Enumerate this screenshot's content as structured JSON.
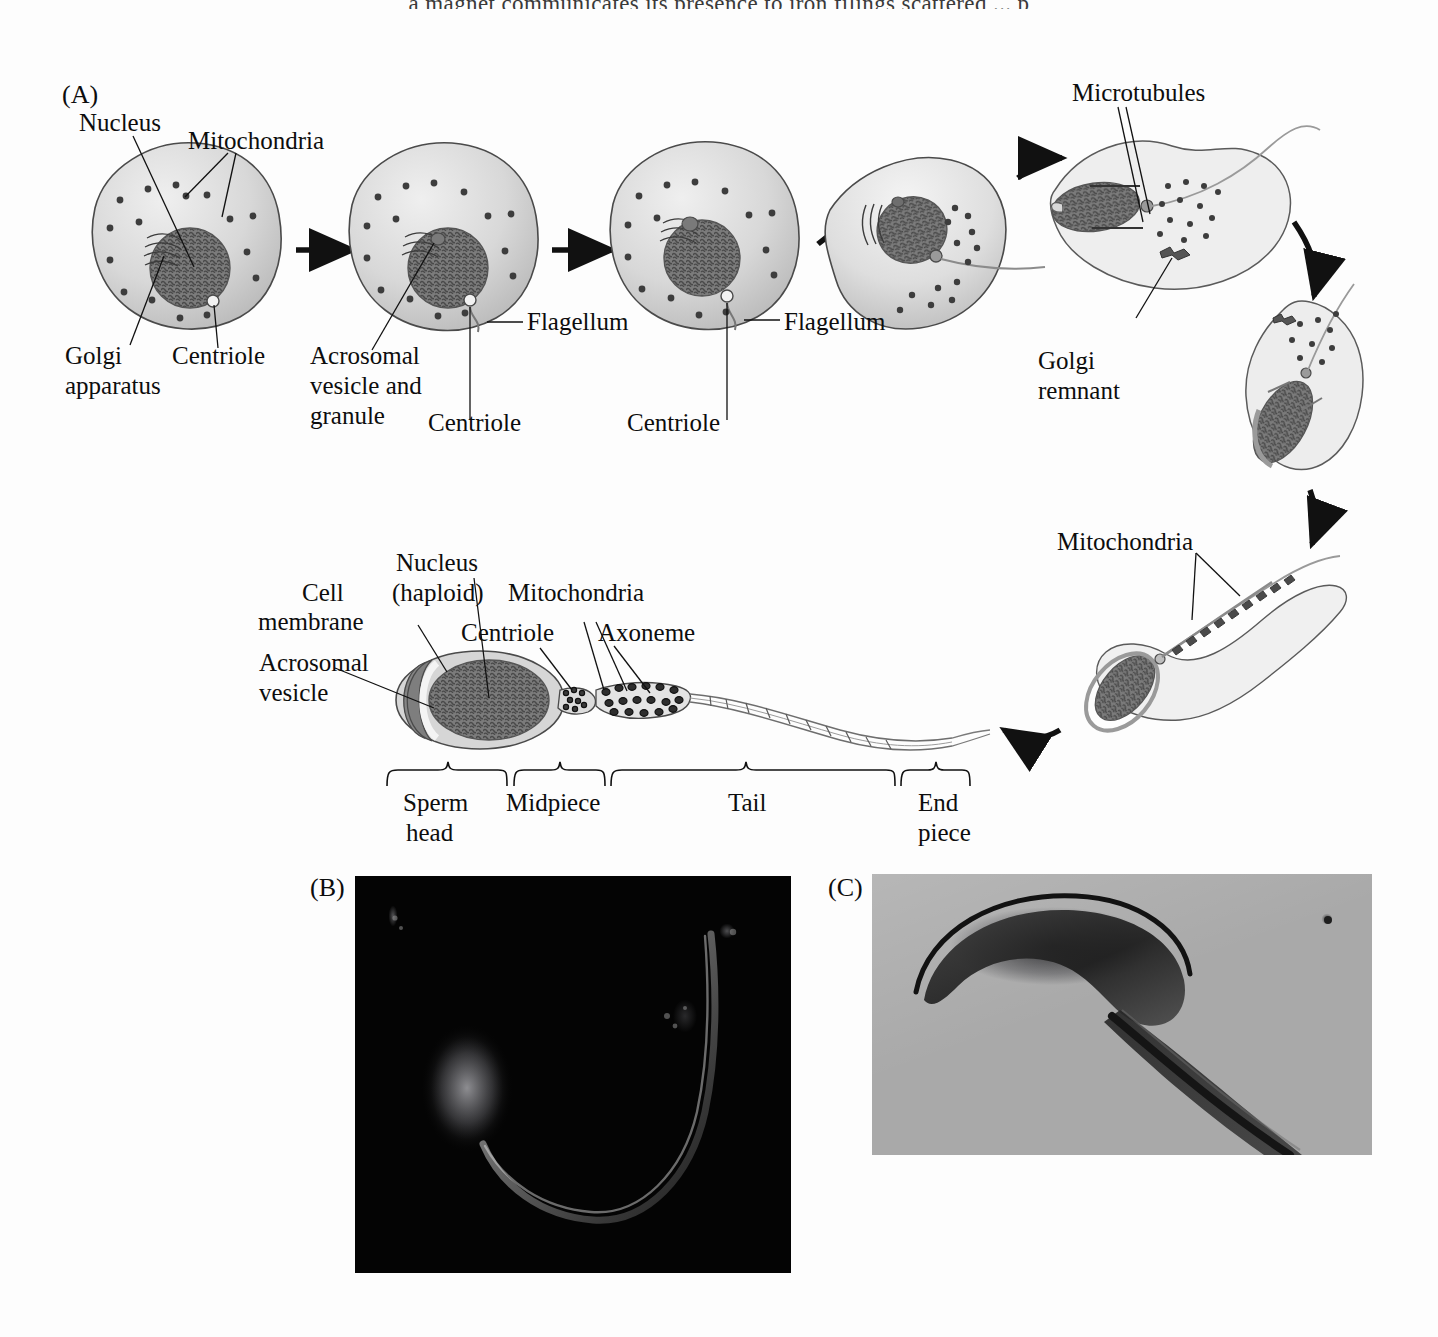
{
  "page": {
    "background_color": "#fdfdfd",
    "cropped_top_text": "a magnet communicates its presence to iron filings scattered ... p"
  },
  "panels": {
    "a": {
      "tag": "(A)"
    },
    "b": {
      "tag": "(B)"
    },
    "c": {
      "tag": "(C)"
    }
  },
  "colors": {
    "ink": "#0d0d0d",
    "cytoplasm": "#cfcfcf",
    "nucleus": "#6e6e6e",
    "acrosome": "#8a8a8a",
    "photo_b_background": "#040404",
    "photo_c_background": "#a9a9a9"
  },
  "stage_labels": {
    "nucleus": "Nucleus",
    "mitochondria": "Mitochondria",
    "golgi_apparatus_line1": "Golgi",
    "golgi_apparatus_line2": "apparatus",
    "centriole": "Centriole",
    "acrosomal_line1": "Acrosomal",
    "acrosomal_line2": "vesicle and",
    "acrosomal_line3": "granule",
    "centriole_2": "Centriole",
    "flagellum_1": "Flagellum",
    "flagellum_2": "Flagellum",
    "centriole_3": "Centriole",
    "microtubules": "Microtubules",
    "golgi_remnant_line1": "Golgi",
    "golgi_remnant_line2": "remnant",
    "mitochondria_right": "Mitochondria"
  },
  "sperm_labels": {
    "cell_membrane_line1": "Cell",
    "cell_membrane_line2": "membrane",
    "nucleus_line1": "Nucleus",
    "nucleus_line2": "(haploid)",
    "mitochondria": "Mitochondria",
    "centriole": "Centriole",
    "axoneme": "Axoneme",
    "acrosomal_line1": "Acrosomal",
    "acrosomal_line2": "vesicle"
  },
  "sperm_regions": [
    {
      "name": "sperm-head",
      "line1": "Sperm",
      "line2": "head"
    },
    {
      "name": "midpiece",
      "line1": "Midpiece",
      "line2": ""
    },
    {
      "name": "tail",
      "line1": "Tail",
      "line2": ""
    },
    {
      "name": "end-piece",
      "line1": "End",
      "line2": "piece"
    }
  ]
}
